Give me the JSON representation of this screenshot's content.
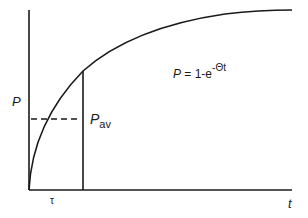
{
  "diagram": {
    "type": "saturation-curve",
    "formula": {
      "lhs": "P",
      "equals": " = 1-e",
      "exponent": "-Θt"
    },
    "labels": {
      "y_axis": "P",
      "x_axis": "t",
      "tau": "τ",
      "p_av_main": "P",
      "p_av_sub": "av"
    },
    "colors": {
      "line": "#1a1a1a",
      "background": "#ffffff"
    }
  }
}
